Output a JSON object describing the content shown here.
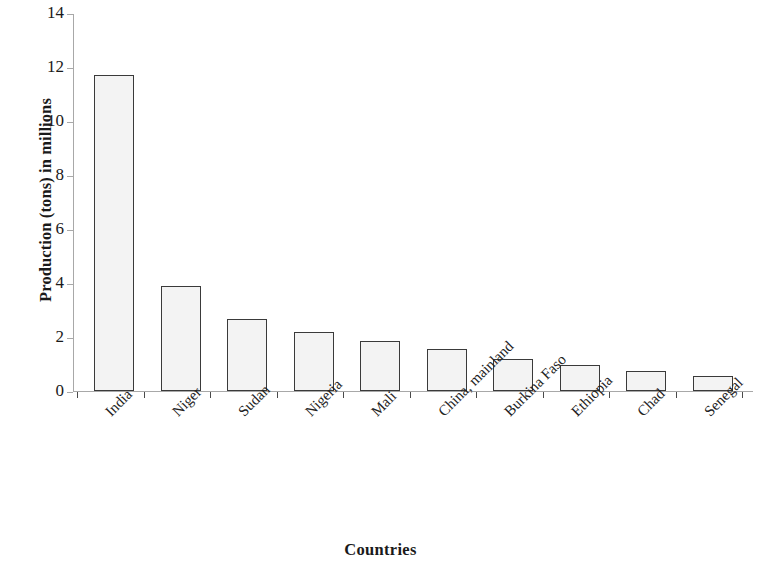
{
  "chart_data": {
    "type": "bar",
    "title": "",
    "subtitle": "",
    "xlabel": "Countries",
    "ylabel": "Production (tons) in millions",
    "categories": [
      "India",
      "Niger",
      "Sudan",
      "Nigeria",
      "Mali",
      "China, mainland",
      "Burkina Faso",
      "Ethiopia",
      "Chad",
      "Senegal"
    ],
    "values": [
      11.7,
      3.9,
      2.65,
      2.2,
      1.85,
      1.55,
      1.2,
      0.95,
      0.73,
      0.55
    ],
    "ylim": [
      0,
      14
    ],
    "ytick_labels": [
      "0",
      "2",
      "4",
      "6",
      "8",
      "10",
      "12",
      "14"
    ],
    "ytick_values": [
      0,
      2,
      4,
      6,
      8,
      10,
      12,
      14
    ],
    "grid": false,
    "legend": false,
    "legend_position": "none",
    "bar_fill_color": "#f3f3f3",
    "bar_border_color": "#3a3a3a",
    "axis_color": "#a8a8a8",
    "background_color": "#ffffff",
    "annotations": []
  }
}
